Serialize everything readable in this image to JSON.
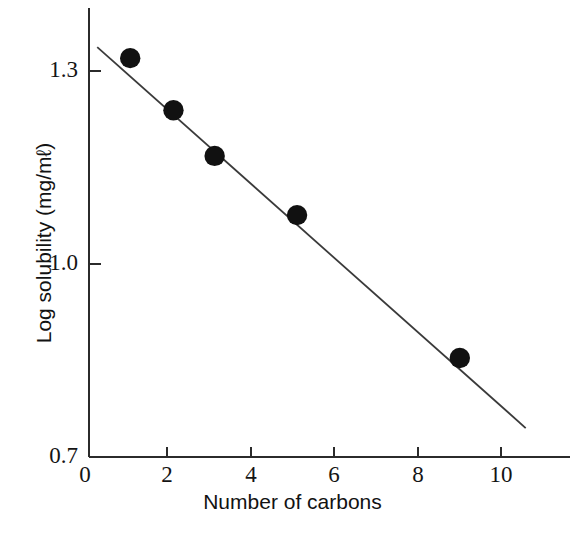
{
  "chart_data": {
    "type": "scatter",
    "title": "",
    "xlabel": "Number of carbons",
    "ylabel": "Log solubility (mg/mℓ)",
    "xlim": [
      0,
      11.6
    ],
    "ylim": [
      0.7,
      1.38
    ],
    "xticks": [
      0,
      2,
      4,
      6,
      8,
      10
    ],
    "xticklabels": [
      "0",
      "2",
      "4",
      "6",
      "8",
      "10"
    ],
    "yticks": [
      0.7,
      1.0,
      1.3
    ],
    "yticklabels": [
      "0.7",
      "1.0",
      "1.3"
    ],
    "grid": false,
    "legend": "none",
    "marker": "filled-circle",
    "marker_color": "#111111",
    "line_color": "#3a3a3a",
    "axis_color": "#2b2b2b",
    "x": [
      1.0,
      2.05,
      3.05,
      5.05,
      9.0
    ],
    "y": [
      1.32,
      1.239,
      1.168,
      1.076,
      0.854
    ],
    "points": [
      {
        "x": 1.0,
        "y": 1.32
      },
      {
        "x": 2.05,
        "y": 1.239
      },
      {
        "x": 3.05,
        "y": 1.168
      },
      {
        "x": 5.05,
        "y": 1.076
      },
      {
        "x": 9.0,
        "y": 0.854
      }
    ],
    "series": [
      {
        "name": "Solubility vs chain length",
        "x": [
          1.0,
          2.05,
          3.05,
          5.05,
          9.0
        ],
        "values": [
          1.32,
          1.239,
          1.168,
          1.076,
          0.854
        ]
      }
    ],
    "trendline": {
      "type": "line",
      "x_start": 0.2,
      "y_start": 1.337,
      "x_end": 10.6,
      "y_end": 0.745
    }
  },
  "axes": {
    "y_tick_0": "1.3",
    "y_tick_1": "1.0",
    "y_tick_2": "0.7",
    "x_tick_0": "0",
    "x_tick_1": "2",
    "x_tick_2": "4",
    "x_tick_3": "6",
    "x_tick_4": "8",
    "x_tick_5": "10",
    "x_axis_title": "Number of carbons",
    "y_axis_title": "Log solubility (mg/mℓ)"
  }
}
